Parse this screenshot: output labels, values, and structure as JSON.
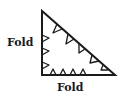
{
  "diagram": {
    "shape": "right-triangle",
    "labels": {
      "left_edge": "Fold",
      "bottom_edge": "Fold"
    },
    "notches": {
      "left_edge": 3,
      "bottom_edge": 4,
      "hypotenuse": 5
    },
    "stroke_color": "#1a1a1a"
  }
}
